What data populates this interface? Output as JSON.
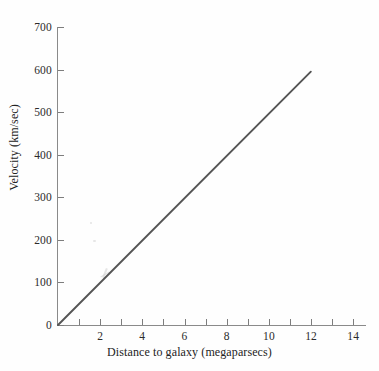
{
  "chart_data": {
    "type": "line",
    "title": "",
    "xlabel": "Distance to galaxy (megaparsecs)",
    "ylabel": "Velocity (km/sec)",
    "xlim": [
      0,
      14.6
    ],
    "ylim": [
      0,
      700
    ],
    "grid": false,
    "legend": null,
    "x_ticks": [
      0,
      1,
      2,
      3,
      4,
      5,
      6,
      7,
      8,
      9,
      10,
      11,
      12,
      13,
      14
    ],
    "x_tick_labels": [
      "0",
      "",
      "2",
      "",
      "4",
      "",
      "6",
      "",
      "8",
      "",
      "10",
      "",
      "12",
      "",
      "14"
    ],
    "y_ticks": [
      0,
      100,
      200,
      300,
      400,
      500,
      600,
      700
    ],
    "y_tick_labels": [
      "0",
      "100",
      "200",
      "300",
      "400",
      "500",
      "600",
      "700"
    ],
    "series": [
      {
        "name": "Hubble relation",
        "color": "#555555",
        "x": [
          0,
          12
        ],
        "values": [
          0,
          595
        ],
        "slope": 49.6,
        "points": [
          {
            "x": 0,
            "y": 0
          },
          {
            "x": 2,
            "y": 99
          },
          {
            "x": 4,
            "y": 198
          },
          {
            "x": 6,
            "y": 298
          },
          {
            "x": 8,
            "y": 397
          },
          {
            "x": 10,
            "y": 496
          },
          {
            "x": 12,
            "y": 595
          }
        ]
      }
    ]
  },
  "axes": {
    "x_title": "Distance to galaxy (megaparsecs)",
    "y_title": "Velocity (km/sec)",
    "axis_color": "#8a8a8a",
    "tick_color": "#7d7d7d",
    "label_color": "#2b2b2b"
  },
  "y_tick_labels": [
    "700",
    "600",
    "500",
    "400",
    "300",
    "200",
    "100",
    "0"
  ],
  "x_tick_labels": [
    "2",
    "4",
    "6",
    "8",
    "10",
    "12",
    "14"
  ]
}
